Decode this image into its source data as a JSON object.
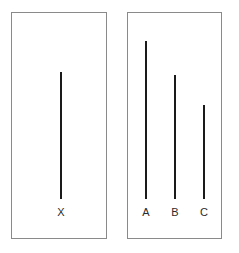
{
  "figure": {
    "name": "line-judgment-task",
    "background_color": "#ffffff",
    "panel_border_color": "#8a8a8a",
    "line_color": "#1a1a1a",
    "label_color": "#2b2b2b"
  },
  "panels": [
    {
      "name": "standard-panel",
      "role": "standard",
      "x": 11,
      "y": 12,
      "width": 96,
      "height": 227
    },
    {
      "name": "comparison-panel",
      "role": "comparison",
      "x": 127,
      "y": 12,
      "width": 95,
      "height": 227
    }
  ],
  "standard_lines": [
    {
      "label": "X",
      "center_x": 49,
      "length": 127,
      "thickness": 2
    }
  ],
  "comparison_lines": [
    {
      "label": "A",
      "center_x": 18,
      "length": 158,
      "thickness": 2
    },
    {
      "label": "B",
      "center_x": 47,
      "length": 124,
      "thickness": 2
    },
    {
      "label": "C",
      "center_x": 76,
      "length": 94,
      "thickness": 2
    }
  ],
  "chart_data": {
    "type": "bar",
    "xlabel": "",
    "ylabel": "Line length (pixels)",
    "orientation": "vertical",
    "grid": false,
    "legend": false,
    "categories": [
      "X",
      "A",
      "B",
      "C"
    ],
    "values": [
      127,
      158,
      124,
      94
    ],
    "ylim": [
      0,
      160
    ],
    "groups": [
      {
        "name": "standard",
        "categories": [
          "X"
        ],
        "values": [
          127
        ]
      },
      {
        "name": "comparison",
        "categories": [
          "A",
          "B",
          "C"
        ],
        "values": [
          158,
          124,
          94
        ]
      }
    ],
    "annotations": [
      "All lines share a common bottom baseline.",
      "Line A is the longest comparison line; line C is the shortest.",
      "Line B most closely matches standard line X."
    ]
  }
}
